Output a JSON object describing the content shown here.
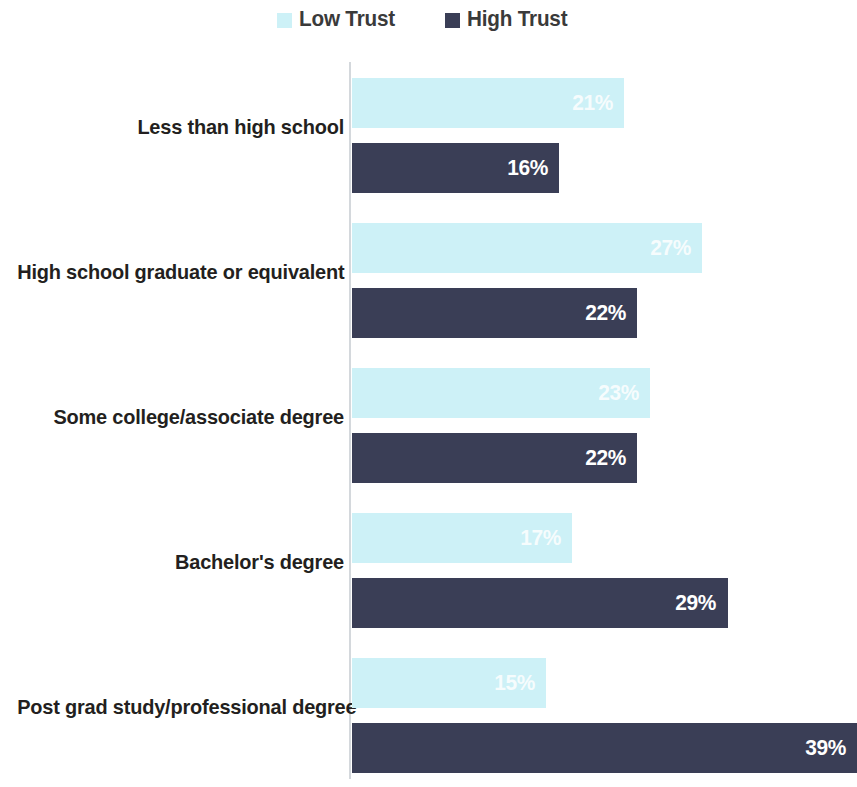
{
  "legend": {
    "entries": [
      {
        "label": "Low Trust",
        "color": "#cdf1f7",
        "icon": "square-swatch"
      },
      {
        "label": "High Trust",
        "color": "#3a3e56",
        "icon": "square-swatch"
      }
    ]
  },
  "chart_data": {
    "type": "bar",
    "orientation": "horizontal",
    "grouped": true,
    "title": "",
    "subtitle": "",
    "xlabel": "",
    "ylabel": "",
    "grid": false,
    "legend_position": "top-center",
    "xlim": [
      0,
      39
    ],
    "value_suffix": "%",
    "categories": [
      "Less than high school",
      "High school graduate or equivalent",
      "Some college/associate degree",
      "Bachelor's degree",
      "Post grad study/professional degree"
    ],
    "series": [
      {
        "name": "Low Trust",
        "color": "#cdf1f7",
        "values": [
          21,
          27,
          23,
          17,
          15
        ],
        "labels": [
          "21%",
          "27%",
          "23%",
          "17%",
          "15%"
        ]
      },
      {
        "name": "High Trust",
        "color": "#3a3e56",
        "values": [
          16,
          22,
          22,
          29,
          39
        ],
        "labels": [
          "16%",
          "22%",
          "22%",
          "29%",
          "39%"
        ]
      }
    ]
  }
}
